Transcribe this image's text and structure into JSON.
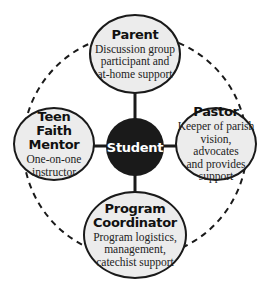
{
  "diagram": {
    "center": {
      "label": "Student"
    },
    "nodes": {
      "parent": {
        "title": "Parent",
        "desc": [
          "Discussion group",
          "participant and",
          "at-home support"
        ]
      },
      "pastor": {
        "title": "Pastor",
        "desc": [
          "Keeper of parish",
          "vision, advocates",
          "and provides",
          "support"
        ]
      },
      "teen": {
        "title": [
          "Teen",
          "Faith Mentor"
        ],
        "desc": [
          "One-on-one",
          "instructor"
        ]
      },
      "coordinator": {
        "title": [
          "Program",
          "Coordinator"
        ],
        "desc": [
          "Program logistics,",
          "management,",
          "catechist support"
        ]
      }
    },
    "colors": {
      "node_fill": "#ececec",
      "stroke": "#1a1a1a",
      "center_fill": "#1a1a1a",
      "center_text": "#ffffff"
    }
  }
}
